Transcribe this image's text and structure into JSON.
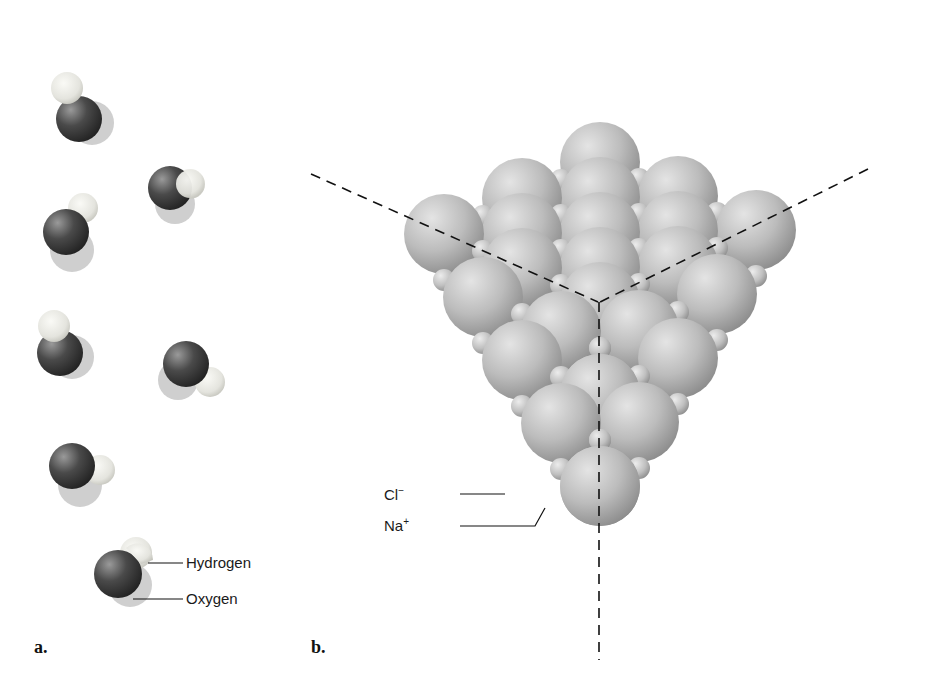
{
  "figure": {
    "panel_a": {
      "letter": "a.",
      "subject": "water molecules (space-filling)",
      "labels": {
        "hydrogen": "Hydrogen",
        "oxygen": "Oxygen"
      },
      "molecule_count": 7
    },
    "panel_b": {
      "letter": "b.",
      "subject": "sodium chloride crystal lattice",
      "labels": {
        "chloride": "Cl",
        "chloride_charge": "−",
        "sodium": "Na",
        "sodium_charge": "+"
      },
      "axes": "three dashed crystal axes meeting at cube corner"
    },
    "colors": {
      "oxygen": "#3a3a3a",
      "hydrogen": "#e6e6e0",
      "chloride": "#bdbdbd",
      "sodium": "#c8c8c8",
      "axis_line": "#111111",
      "background": "#ffffff"
    }
  }
}
